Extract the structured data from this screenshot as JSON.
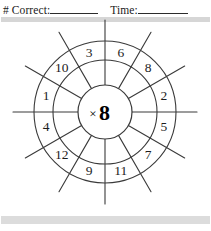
{
  "header": {
    "correct_label": "# Correct:",
    "time_label": "Time:",
    "correct_blank": "",
    "time_blank": ""
  },
  "wheel": {
    "center_operator": "×",
    "center_factor": "8",
    "center_text": "×8",
    "segment_count": 12,
    "segments": [
      {
        "position": 1,
        "label": "6"
      },
      {
        "position": 2,
        "label": "8"
      },
      {
        "position": 3,
        "label": "2"
      },
      {
        "position": 4,
        "label": "5"
      },
      {
        "position": 5,
        "label": "7"
      },
      {
        "position": 6,
        "label": "11"
      },
      {
        "position": 7,
        "label": "9"
      },
      {
        "position": 8,
        "label": "12"
      },
      {
        "position": 9,
        "label": "4"
      },
      {
        "position": 10,
        "label": "1"
      },
      {
        "position": 11,
        "label": "10"
      },
      {
        "position": 12,
        "label": "3"
      }
    ]
  },
  "colors": {
    "ink": "#1c1c1c",
    "line": "#3a3a3a",
    "divider": "#d6d6d6",
    "paper": "#ffffff"
  }
}
